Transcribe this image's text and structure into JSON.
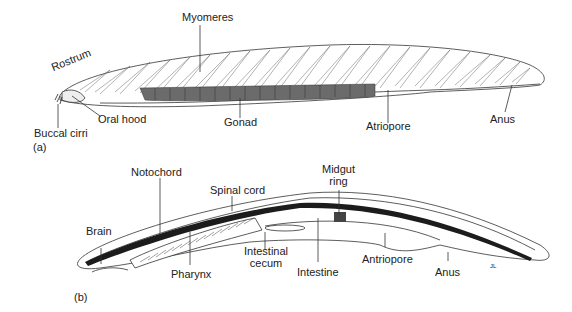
{
  "figure": {
    "panel_a": {
      "panel_label": "(a)",
      "labels": {
        "rostrum": "Rostrum",
        "myomeres": "Myomeres",
        "buccal_cirri": "Buccal cirri",
        "oral_hood": "Oral hood",
        "gonad": "Gonad",
        "atriopore": "Atriopore",
        "anus": "Anus"
      }
    },
    "panel_b": {
      "panel_label": "(b)",
      "labels": {
        "notochord": "Notochord",
        "spinal_cord": "Spinal cord",
        "midgut_ring_line1": "Midgut",
        "midgut_ring_line2": "ring",
        "brain": "Brain",
        "pharynx": "Pharynx",
        "intestinal_cecum_line1": "Intestinal",
        "intestinal_cecum_line2": "cecum",
        "intestine": "Intestine",
        "antriopore": "Antriopore",
        "anus": "Anus"
      },
      "signature": "JL"
    },
    "colors": {
      "line": "#333333",
      "gonad_fill": "#6b6b6b",
      "notochord_fill": "#1c1c1c",
      "background": "#ffffff"
    }
  }
}
